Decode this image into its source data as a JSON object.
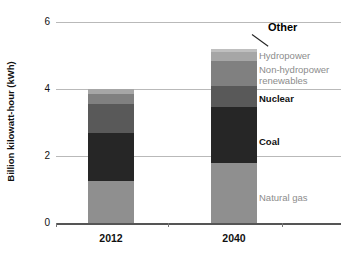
{
  "chart_data": {
    "type": "bar",
    "subtype": "stacked-bar",
    "title": "",
    "xlabel": "",
    "ylabel": "Billion kilowatt-hour (kWh)",
    "categories": [
      "2012",
      "2040"
    ],
    "ylim": [
      0,
      6
    ],
    "yticks": [
      "0",
      "2",
      "4",
      "6"
    ],
    "ytick_values": [
      0,
      2,
      4,
      6
    ],
    "grid": true,
    "legend_position": "right-inline-labels",
    "series": [
      {
        "name": "Natural gas",
        "values": [
          1.25,
          1.8
        ],
        "color": "#8f8f8f",
        "label_color": "#8c8c8c"
      },
      {
        "name": "Coal",
        "values": [
          1.45,
          1.65
        ],
        "color": "#262626",
        "label_color": "#111111"
      },
      {
        "name": "Nuclear",
        "values": [
          0.85,
          0.65
        ],
        "color": "#595959",
        "label_color": "#111111"
      },
      {
        "name": "Non-hydropower renewables",
        "values": [
          0.3,
          0.75
        ],
        "color": "#808080",
        "label_color": "#8c8c8c"
      },
      {
        "name": "Hydropower",
        "values": [
          0.15,
          0.25
        ],
        "color": "#a6a6a6",
        "label_color": "#8c8c8c"
      },
      {
        "name": "Other",
        "values": [
          0.0,
          0.1
        ],
        "color": "#bfbfbf",
        "label_color": "#000000"
      }
    ],
    "totals": [
      4.0,
      5.2
    ]
  },
  "annotations": {
    "other_label": "Other",
    "hydropower_label": "Hydropower",
    "renewables_line1": "Non-hydropower",
    "renewables_line2": "renewables",
    "nuclear_label": "Nuclear",
    "coal_label": "Coal",
    "natural_gas_label": "Natural gas"
  }
}
